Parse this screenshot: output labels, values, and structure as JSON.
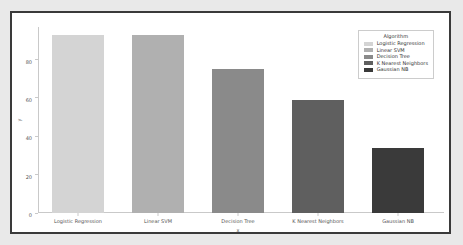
{
  "chart_data": {
    "type": "bar",
    "title": "",
    "xlabel": "x",
    "ylabel": "y",
    "categories": [
      "Logistic Regression",
      "Linear SVM",
      "Decision Tree",
      "K Nearest Neighbors",
      "Gaussian NB"
    ],
    "values": [
      93,
      93,
      75,
      59,
      34
    ],
    "ylim": [
      0,
      97
    ],
    "yticks": [
      0,
      20,
      40,
      60,
      80
    ],
    "ytick_labels": [
      "0",
      "20",
      "40",
      "60",
      "80"
    ],
    "grid": false,
    "legend": {
      "title": "Algorithm",
      "position": "upper-right-inside",
      "entries": [
        {
          "label": "Logistic Regression",
          "color": "#d4d4d4"
        },
        {
          "label": "Linear SVM",
          "color": "#b0b0b0"
        },
        {
          "label": "Decision Tree",
          "color": "#8a8a8a"
        },
        {
          "label": "K Nearest Neighbors",
          "color": "#5f5f5f"
        },
        {
          "label": "Gaussian NB",
          "color": "#3a3a3a"
        }
      ]
    },
    "bar_colors": [
      "#d4d4d4",
      "#b0b0b0",
      "#8a8a8a",
      "#5f5f5f",
      "#3a3a3a"
    ],
    "background_color": "#ffffff",
    "page_background_color": "#e9e9e9",
    "frame_color": "#3a3a3a"
  }
}
